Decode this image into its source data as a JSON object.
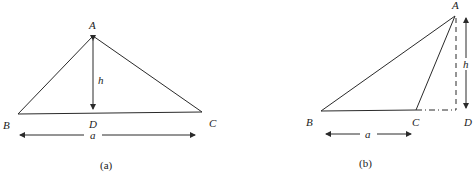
{
  "figure_a": {
    "caption": "(a)",
    "vertices": {
      "A": "A",
      "B": "B",
      "C": "C",
      "D": "D"
    },
    "height_label": "h",
    "base_label": "a"
  },
  "figure_b": {
    "caption": "(b)",
    "vertices": {
      "A": "A",
      "B": "B",
      "C": "C",
      "D": "D"
    },
    "height_label": "h",
    "base_label": "a"
  },
  "colors": {
    "stroke": "#2a2a2a",
    "background": "#ffffff"
  }
}
